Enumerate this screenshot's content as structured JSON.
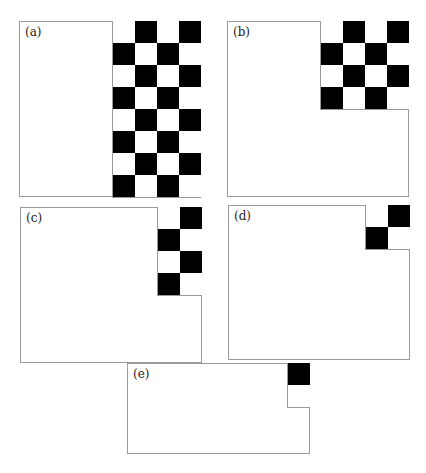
{
  "colors": {
    "black": "#000000",
    "white": "#ffffff",
    "frame": "#9a9a9a"
  },
  "panels": [
    {
      "label": "(a)",
      "cols": 4,
      "rows": 8,
      "first_cell": "white",
      "box": {
        "x": 19,
        "y": 21,
        "w": 182,
        "h": 176
      }
    },
    {
      "label": "(b)",
      "cols": 4,
      "rows": 4,
      "first_cell": "white",
      "box": {
        "x": 227,
        "y": 21,
        "w": 182,
        "h": 176
      }
    },
    {
      "label": "(c)",
      "cols": 2,
      "rows": 4,
      "first_cell": "white",
      "box": {
        "x": 20,
        "y": 207,
        "w": 182,
        "h": 156
      }
    },
    {
      "label": "(d)",
      "cols": 2,
      "rows": 2,
      "first_cell": "white",
      "box": {
        "x": 228,
        "y": 205,
        "w": 182,
        "h": 155
      }
    },
    {
      "label": "(e)",
      "cols": 1,
      "rows": 2,
      "first_cell": "black",
      "box": {
        "x": 127,
        "y": 363,
        "w": 183,
        "h": 91
      }
    }
  ]
}
